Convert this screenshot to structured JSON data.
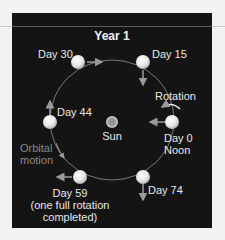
{
  "title": "Year 1",
  "center_body": {
    "label": "Sun"
  },
  "positions": [
    {
      "label": "Day 0",
      "sublabel": "Noon"
    },
    {
      "label": "Day 15"
    },
    {
      "label": "Day 30"
    },
    {
      "label": "Day 44"
    },
    {
      "label": "Day 59",
      "sublabel": "(one full rotation",
      "sublabel2": "completed)"
    },
    {
      "label": "Day 74"
    }
  ],
  "annotations": {
    "rotation": "Rotation",
    "orbital_motion_line1": "Orbital",
    "orbital_motion_line2": "motion"
  },
  "colors": {
    "panel_bg": "#141414",
    "page_bg": "#f2f2f2",
    "text": "#e8e8e8",
    "orbit": "#7a7a7a",
    "arrow": "#9a9a9a"
  }
}
